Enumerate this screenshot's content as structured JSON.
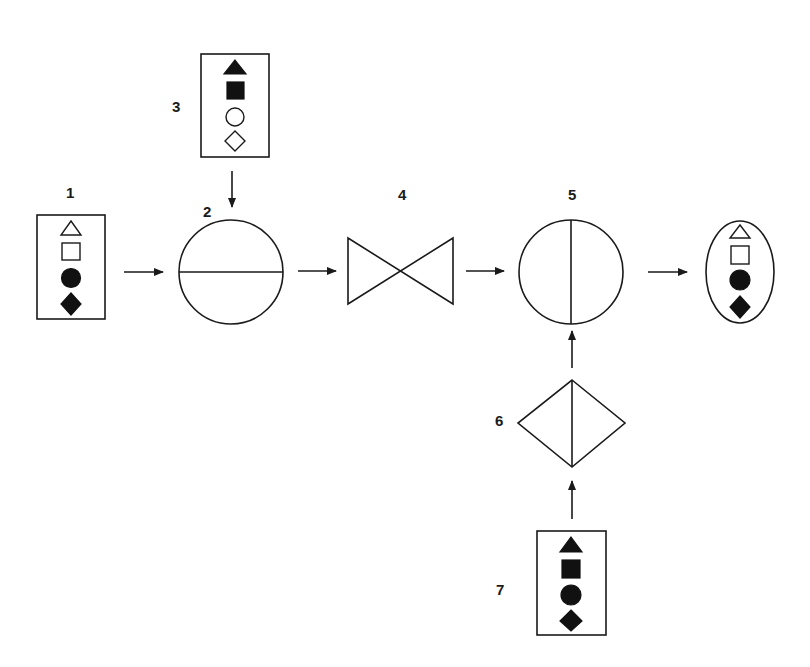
{
  "diagram": {
    "background": "#ffffff",
    "ink": "#1a1a1a",
    "nodes": [
      {
        "id": "1",
        "label": "1",
        "type": "input-box",
        "symbols": [
          "triangle-outline",
          "square-outline",
          "circle-filled",
          "diamond-filled"
        ]
      },
      {
        "id": "2",
        "label": "2",
        "type": "circle-horizontal-divider"
      },
      {
        "id": "3",
        "label": "3",
        "type": "input-box",
        "symbols": [
          "triangle-filled",
          "square-filled",
          "circle-outline",
          "diamond-outline"
        ]
      },
      {
        "id": "4",
        "label": "4",
        "type": "bowtie-valve"
      },
      {
        "id": "5",
        "label": "5",
        "type": "circle-vertical-divider"
      },
      {
        "id": "6",
        "label": "6",
        "type": "diamond-vertical-divider"
      },
      {
        "id": "7",
        "label": "7",
        "type": "input-box",
        "symbols": [
          "triangle-filled",
          "square-filled",
          "circle-filled",
          "diamond-filled"
        ]
      },
      {
        "id": "output",
        "label": "",
        "type": "output-ellipse",
        "symbols": [
          "triangle-outline",
          "square-outline",
          "circle-filled",
          "diamond-filled"
        ]
      }
    ],
    "edges": [
      {
        "from": "1",
        "to": "2"
      },
      {
        "from": "3",
        "to": "2"
      },
      {
        "from": "2",
        "to": "4"
      },
      {
        "from": "4",
        "to": "5"
      },
      {
        "from": "5",
        "to": "output"
      },
      {
        "from": "6",
        "to": "5"
      },
      {
        "from": "7",
        "to": "6"
      }
    ],
    "labels": {
      "n1": "1",
      "n2": "2",
      "n3": "3",
      "n4": "4",
      "n5": "5",
      "n6": "6",
      "n7": "7"
    }
  }
}
